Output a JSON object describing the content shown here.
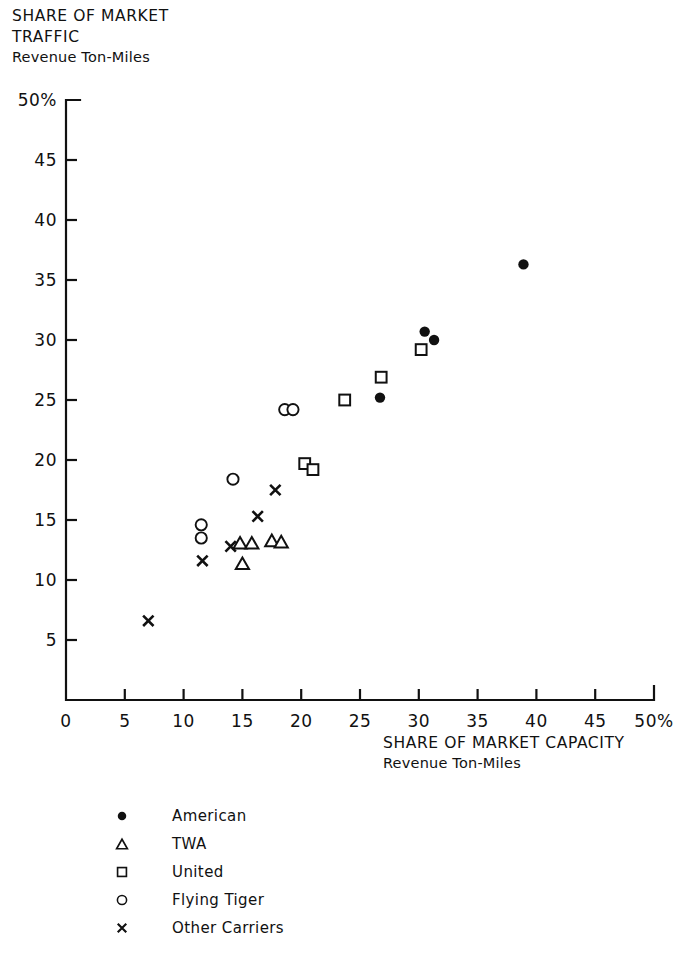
{
  "title": {
    "line1": "SHARE OF MARKET",
    "line2": "TRAFFIC",
    "line3": "Revenue Ton-Miles"
  },
  "xaxis_caption": {
    "line1": "SHARE OF MARKET CAPACITY",
    "line2": "Revenue Ton-Miles"
  },
  "legend": {
    "items": [
      {
        "marker": "filled-circle",
        "label": "American"
      },
      {
        "marker": "triangle",
        "label": "TWA"
      },
      {
        "marker": "square",
        "label": "United"
      },
      {
        "marker": "open-circle",
        "label": "Flying Tiger"
      },
      {
        "marker": "cross",
        "label": "Other Carriers"
      }
    ]
  },
  "colors": {
    "ink": "#111111",
    "background": "#ffffff"
  },
  "chart_data": {
    "type": "scatter",
    "xlabel": "SHARE OF MARKET CAPACITY Revenue Ton-Miles",
    "ylabel": "SHARE OF MARKET TRAFFIC Revenue Ton-Miles",
    "xlim": [
      0,
      50
    ],
    "ylim": [
      0,
      50
    ],
    "xticks": [
      0,
      5,
      10,
      15,
      20,
      25,
      30,
      35,
      40,
      45,
      50
    ],
    "yticks": [
      0,
      5,
      10,
      15,
      20,
      25,
      30,
      35,
      40,
      45,
      50
    ],
    "xtick_labels": [
      "0",
      "5",
      "10",
      "15",
      "20",
      "25",
      "30",
      "35",
      "40",
      "45",
      "50%"
    ],
    "ytick_labels": [
      "0",
      "5",
      "10",
      "15",
      "20",
      "25",
      "30",
      "35",
      "40",
      "45",
      "50%"
    ],
    "grid": false,
    "legend_position": "below-plot-left",
    "units": "percent",
    "series": [
      {
        "name": "American",
        "marker": "filled-circle",
        "points": [
          {
            "x": 38.9,
            "y": 36.3
          },
          {
            "x": 30.5,
            "y": 30.7
          },
          {
            "x": 31.3,
            "y": 30.0
          },
          {
            "x": 26.7,
            "y": 25.2
          }
        ]
      },
      {
        "name": "TWA",
        "marker": "triangle",
        "points": [
          {
            "x": 14.8,
            "y": 13.1
          },
          {
            "x": 15.8,
            "y": 13.1
          },
          {
            "x": 17.5,
            "y": 13.3
          },
          {
            "x": 18.3,
            "y": 13.2
          },
          {
            "x": 15.0,
            "y": 11.4
          }
        ]
      },
      {
        "name": "United",
        "marker": "square",
        "points": [
          {
            "x": 30.2,
            "y": 29.2
          },
          {
            "x": 26.8,
            "y": 26.9
          },
          {
            "x": 23.7,
            "y": 25.0
          },
          {
            "x": 20.3,
            "y": 19.7
          },
          {
            "x": 21.0,
            "y": 19.2
          }
        ]
      },
      {
        "name": "Flying Tiger",
        "marker": "open-circle",
        "points": [
          {
            "x": 18.6,
            "y": 24.2
          },
          {
            "x": 19.3,
            "y": 24.2
          },
          {
            "x": 14.2,
            "y": 18.4
          },
          {
            "x": 11.5,
            "y": 14.6
          },
          {
            "x": 11.5,
            "y": 13.5
          }
        ]
      },
      {
        "name": "Other Carriers",
        "marker": "cross",
        "points": [
          {
            "x": 17.8,
            "y": 17.5
          },
          {
            "x": 16.3,
            "y": 15.3
          },
          {
            "x": 14.0,
            "y": 12.8
          },
          {
            "x": 11.6,
            "y": 11.6
          },
          {
            "x": 7.0,
            "y": 6.6
          }
        ]
      }
    ]
  },
  "axes_geometry": {
    "origin_px": {
      "x": 66,
      "y": 700
    },
    "x_end_px": 654,
    "y_top_px": 100,
    "tick_len_px": 11
  }
}
